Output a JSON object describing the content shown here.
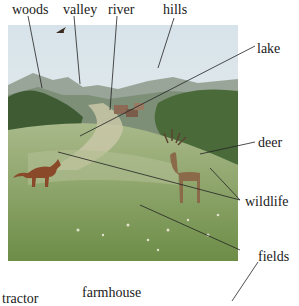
{
  "labels": {
    "woods": "woods",
    "valley": "valley",
    "river": "river",
    "hills": "hills",
    "lake": "lake",
    "deer": "deer",
    "wildlife": "wildlife",
    "fields": "fields",
    "tractor": "tractor",
    "farmhouse": "farmhouse"
  },
  "colors": {
    "sky": "#e8eef2",
    "hills": "#8a9a8c",
    "woods": "#3f5b34",
    "fields": "#7e9c5a",
    "path": "#c9c7a8",
    "fox": "#8a4a2a",
    "deer": "#8a6a48"
  }
}
